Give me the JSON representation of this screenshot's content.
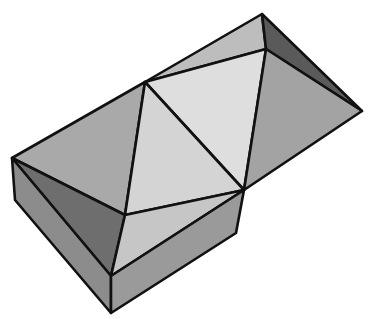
{
  "figure": {
    "stroke_color": "#111111",
    "background": "#ffffff",
    "faces": [
      {
        "name": "left-roof-face",
        "fill": "#a9a9a9",
        "points": "12,158 145,82 125,215"
      },
      {
        "name": "top-left-ridge-face",
        "fill": "#bdbdbd",
        "points": "145,82 262,14 266,49"
      },
      {
        "name": "center-top-face",
        "fill": "#dedede",
        "points": "145,82 266,49 244,190"
      },
      {
        "name": "center-lower-face",
        "fill": "#d4d4d4",
        "points": "145,82 244,190 125,215"
      },
      {
        "name": "top-right-dark-face",
        "fill": "#5a5a5a",
        "points": "262,14 362,111 266,49"
      },
      {
        "name": "right-roof-face",
        "fill": "#a3a3a3",
        "points": "266,49 362,111 244,190"
      },
      {
        "name": "front-left-dark-face",
        "fill": "#6e6e6e",
        "points": "12,158 125,215 111,276"
      },
      {
        "name": "front-right-light-face",
        "fill": "#c6c6c6",
        "points": "125,215 244,190 111,276"
      },
      {
        "name": "box-left-side",
        "fill": "#8c8c8c",
        "points": "12,158 111,276 111,313 15,200"
      },
      {
        "name": "box-right-side",
        "fill": "#9a9a9a",
        "points": "111,276 244,190 236,233 111,313"
      }
    ]
  }
}
